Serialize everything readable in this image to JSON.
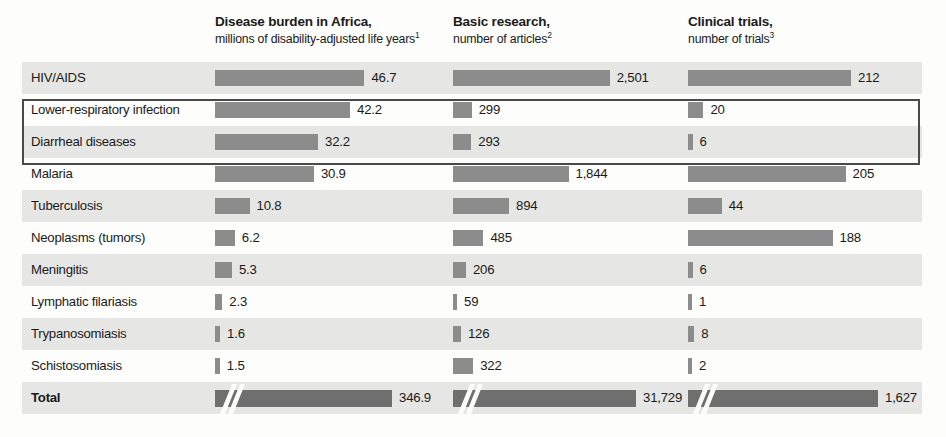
{
  "columns": [
    {
      "key": "burden",
      "title": "Disease burden in Africa,",
      "subtitle": "millions of disability-adjusted life years",
      "footnote": "1"
    },
    {
      "key": "research",
      "title": "Basic research,",
      "subtitle": "number of articles",
      "footnote": "2"
    },
    {
      "key": "trials",
      "title": "Clinical trials,",
      "subtitle": "number of trials",
      "footnote": "3"
    }
  ],
  "rows": [
    {
      "label": "HIV/AIDS",
      "burden": "46.7",
      "research": "2,501",
      "trials": "212"
    },
    {
      "label": "Lower-respiratory infection",
      "burden": "42.2",
      "research": "299",
      "trials": "20"
    },
    {
      "label": "Diarrheal diseases",
      "burden": "32.2",
      "research": "293",
      "trials": "6"
    },
    {
      "label": "Malaria",
      "burden": "30.9",
      "research": "1,844",
      "trials": "205"
    },
    {
      "label": "Tuberculosis",
      "burden": "10.8",
      "research": "894",
      "trials": "44"
    },
    {
      "label": "Neoplasms (tumors)",
      "burden": "6.2",
      "research": "485",
      "trials": "188"
    },
    {
      "label": "Meningitis",
      "burden": "5.3",
      "research": "206",
      "trials": "6"
    },
    {
      "label": "Lymphatic filariasis",
      "burden": "2.3",
      "research": "59",
      "trials": "1"
    },
    {
      "label": "Trypanosomiasis",
      "burden": "1.6",
      "research": "126",
      "trials": "8"
    },
    {
      "label": "Schistosomiasis",
      "burden": "1.5",
      "research": "322",
      "trials": "2"
    },
    {
      "label": "Total",
      "burden": "346.9",
      "research": "31,729",
      "trials": "1,627"
    }
  ],
  "highlight": {
    "rows": [
      "Lower-respiratory infection",
      "Diarrheal diseases"
    ]
  },
  "colors": {
    "bar": "#8c8c8c",
    "bar_total": "#6f6f6f",
    "row_shaded": "#e6e6e4",
    "row_plain": "#fdfdfc",
    "highlight_border": "#4a4a4a",
    "text": "#1b1b1b"
  },
  "chart_data": {
    "type": "bar",
    "title": "",
    "categories": [
      "HIV/AIDS",
      "Lower-respiratory infection",
      "Diarrheal diseases",
      "Malaria",
      "Tuberculosis",
      "Neoplasms (tumors)",
      "Meningitis",
      "Lymphatic filariasis",
      "Trypanosomiasis",
      "Schistosomiasis",
      "Total"
    ],
    "series": [
      {
        "name": "Disease burden in Africa, millions of disability-adjusted life years",
        "unit": "millions of DALYs",
        "footnote": "1",
        "values": [
          46.7,
          42.2,
          32.2,
          30.9,
          10.8,
          6.2,
          5.3,
          2.3,
          1.6,
          1.5,
          346.9
        ],
        "axis_max": 50,
        "total_broken_axis": true
      },
      {
        "name": "Basic research, number of articles",
        "unit": "articles",
        "footnote": "2",
        "values": [
          2501,
          299,
          293,
          1844,
          894,
          485,
          206,
          59,
          126,
          322,
          31729
        ],
        "axis_max": 2650,
        "total_broken_axis": true
      },
      {
        "name": "Clinical trials, number of trials",
        "unit": "trials",
        "footnote": "3",
        "values": [
          212,
          20,
          6,
          205,
          44,
          188,
          6,
          1,
          8,
          2,
          1627
        ],
        "axis_max": 225,
        "total_broken_axis": true
      }
    ],
    "xlabel": "",
    "ylabel": "",
    "grid": false,
    "legend": "none",
    "orientation": "horizontal",
    "highlighted_categories": [
      "Lower-respiratory infection",
      "Diarrheal diseases"
    ]
  }
}
